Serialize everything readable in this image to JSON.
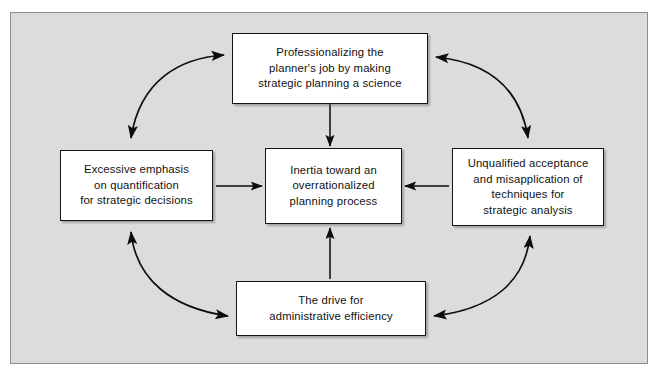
{
  "diagram": {
    "frame": {
      "background_color": "#dcdcdc",
      "border_color": "#8d8d8d"
    },
    "node_style": {
      "background_color": "#ffffff",
      "border_color": "#141414",
      "text_color": "#111111"
    },
    "nodes": [
      {
        "id": "professionalizing",
        "name": "node-professionalizing",
        "label": "Professionalizing the\nplanner's job by making\nstrategic planning a science"
      },
      {
        "id": "excessive-emphasis",
        "name": "node-excessive-emphasis",
        "label": "Excessive emphasis\non quantification\nfor strategic decisions"
      },
      {
        "id": "inertia",
        "name": "node-inertia",
        "label": "Inertia toward an\noverrationalized\nplanning process"
      },
      {
        "id": "unqualified-acceptance",
        "name": "node-unqualified-acceptance",
        "label": "Unqualified acceptance\nand misapplication of\ntechniques for\nstrategic analysis"
      },
      {
        "id": "administrative-efficiency",
        "name": "node-administrative-efficiency",
        "label": "The drive for\nadministrative efficiency"
      }
    ],
    "connectors": [
      {
        "id": "top-to-center",
        "name": "arrow-top-to-center",
        "from": "professionalizing",
        "to": "inertia",
        "style": "straight",
        "heads": "single",
        "direction": "down"
      },
      {
        "id": "left-to-center",
        "name": "arrow-left-to-center",
        "from": "excessive-emphasis",
        "to": "inertia",
        "style": "straight",
        "heads": "single",
        "direction": "right"
      },
      {
        "id": "right-to-center",
        "name": "arrow-right-to-center",
        "from": "unqualified-acceptance",
        "to": "inertia",
        "style": "straight",
        "heads": "single",
        "direction": "left"
      },
      {
        "id": "bottom-to-center",
        "name": "arrow-bottom-to-center",
        "from": "administrative-efficiency",
        "to": "inertia",
        "style": "straight",
        "heads": "single",
        "direction": "up"
      },
      {
        "id": "top-left-curve",
        "name": "curve-professionalizing-excessive-emphasis",
        "from": "professionalizing",
        "to": "excessive-emphasis",
        "style": "curved",
        "heads": "double"
      },
      {
        "id": "top-right-curve",
        "name": "curve-professionalizing-unqualified-acceptance",
        "from": "professionalizing",
        "to": "unqualified-acceptance",
        "style": "curved",
        "heads": "double"
      },
      {
        "id": "bottom-left-curve",
        "name": "curve-excessive-emphasis-administrative-efficiency",
        "from": "excessive-emphasis",
        "to": "administrative-efficiency",
        "style": "curved",
        "heads": "double"
      },
      {
        "id": "bottom-right-curve",
        "name": "curve-administrative-efficiency-unqualified-acceptance",
        "from": "administrative-efficiency",
        "to": "unqualified-acceptance",
        "style": "curved",
        "heads": "double"
      }
    ]
  }
}
